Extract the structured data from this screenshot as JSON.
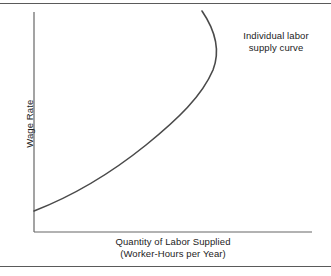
{
  "figure": {
    "background_color": "#ffffff",
    "rule_color": "#5a5a5a",
    "axis_color": "#666666",
    "curve_color": "#4a4a4a",
    "text_color": "#1c1c1c"
  },
  "chart_data": {
    "type": "line",
    "title": "",
    "subtitle": "",
    "xlabel_line1": "Quantity of Labor Supplied",
    "xlabel_line2": "(Worker-Hours per Year)",
    "ylabel": "Wage Rate",
    "grid": false,
    "legend_position": "none",
    "annotations": [
      {
        "line1": "Individual labor",
        "line2": "supply curve",
        "x_px": 276,
        "y_px": 42
      }
    ],
    "axes": {
      "x_axis_px": {
        "x_start": 34,
        "x_end": 312,
        "y": 232
      },
      "y_axis_px": {
        "x": 34,
        "y_start": 12,
        "y_end": 232
      },
      "xlim": [
        0,
        1
      ],
      "ylim": [
        0,
        1
      ],
      "xticks": [],
      "yticks": [],
      "xticklabels": [],
      "yticklabels": []
    },
    "series": [
      {
        "name": "Individual labor supply curve",
        "shape": "backward-bending",
        "color": "#4a4a4a",
        "linewidth": 1.6,
        "points_px": [
          [
            34,
            211
          ],
          [
            52,
            203
          ],
          [
            72,
            194
          ],
          [
            92,
            183
          ],
          [
            110,
            172
          ],
          [
            128,
            159
          ],
          [
            146,
            145
          ],
          [
            162,
            131
          ],
          [
            176,
            116
          ],
          [
            188,
            101
          ],
          [
            197,
            89
          ],
          [
            205,
            78
          ],
          [
            211,
            68
          ],
          [
            215,
            57
          ],
          [
            217,
            46
          ],
          [
            216,
            38
          ],
          [
            213,
            29
          ],
          [
            209,
            21
          ],
          [
            205,
            15
          ],
          [
            202,
            11
          ]
        ],
        "path_d": "M 34 211 C 70 197 110 174 146 145 C 178 119 202 96 213 70 C 220 52 217 33 202 11"
      }
    ]
  }
}
